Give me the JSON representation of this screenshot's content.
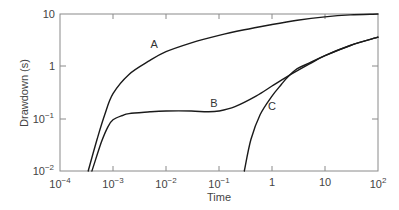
{
  "chart_data": {
    "type": "line",
    "title": "",
    "xlabel": "Time",
    "ylabel": "Drawdown (s)",
    "xscale": "log",
    "yscale": "log",
    "xlim": [
      0.0001,
      100
    ],
    "ylim": [
      0.01,
      10
    ],
    "grid": false,
    "legend": "none (inline curve labels A, B, C)",
    "x_ticks": [
      "10^-4",
      "10^-3",
      "10^-2",
      "10^-1",
      "1",
      "10",
      "10^2"
    ],
    "y_ticks": [
      "10^-2",
      "10^-1",
      "1",
      "10"
    ],
    "series": [
      {
        "name": "A",
        "x": [
          0.00034,
          0.0005,
          0.0007,
          0.001,
          0.002,
          0.005,
          0.01,
          0.03,
          0.1,
          0.3,
          1,
          3,
          10,
          30,
          100
        ],
        "y": [
          0.01,
          0.04,
          0.12,
          0.3,
          0.7,
          1.3,
          1.9,
          2.8,
          3.9,
          5.0,
          6.3,
          7.6,
          8.8,
          9.6,
          10
        ]
      },
      {
        "name": "B",
        "x": [
          0.0004,
          0.0006,
          0.0008,
          0.001,
          0.0015,
          0.002,
          0.005,
          0.01,
          0.03,
          0.06,
          0.1,
          0.2,
          0.5,
          1,
          2,
          5,
          10,
          30,
          100
        ],
        "y": [
          0.01,
          0.035,
          0.07,
          0.095,
          0.115,
          0.125,
          0.135,
          0.14,
          0.14,
          0.135,
          0.14,
          0.17,
          0.27,
          0.42,
          0.65,
          1.1,
          1.6,
          2.5,
          3.6
        ]
      },
      {
        "name": "C",
        "x": [
          0.3,
          0.4,
          0.6,
          1,
          1.5,
          2,
          3,
          5,
          10,
          30,
          100
        ],
        "y": [
          0.01,
          0.04,
          0.12,
          0.27,
          0.45,
          0.63,
          0.9,
          1.15,
          1.6,
          2.5,
          3.6
        ]
      }
    ],
    "annotations": [
      {
        "text": "A",
        "x": 0.006,
        "y": 2.2
      },
      {
        "text": "B",
        "x": 0.08,
        "y": 0.17
      },
      {
        "text": "C",
        "x": 1.0,
        "y": 0.15
      }
    ]
  },
  "axes": {
    "xlabel": "Time",
    "ylabel": "Drawdown (s)",
    "x_tick_labels": [
      {
        "base": "10",
        "exp": "−4"
      },
      {
        "base": "10",
        "exp": "−3"
      },
      {
        "base": "10",
        "exp": "−2"
      },
      {
        "base": "10",
        "exp": "−1"
      },
      {
        "base": "1",
        "exp": ""
      },
      {
        "base": "10",
        "exp": ""
      },
      {
        "base": "10",
        "exp": "2"
      }
    ],
    "y_tick_labels": [
      {
        "base": "10",
        "exp": "−2"
      },
      {
        "base": "10",
        "exp": "−1"
      },
      {
        "base": "1",
        "exp": ""
      },
      {
        "base": "10",
        "exp": ""
      }
    ]
  },
  "colors": {
    "curve": "#1a1a1a",
    "frame": "#888888",
    "text": "#444444"
  }
}
